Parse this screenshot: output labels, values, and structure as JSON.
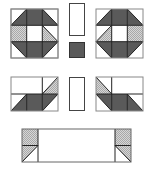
{
  "diagram": {
    "title": "",
    "colors": {
      "dark": "#5a5a5a",
      "check": "#c8c8c8",
      "white": "#ffffff",
      "line": "#2a2a2a",
      "border": "#8a8a8a"
    },
    "pieces": [
      {
        "name": "top-left-block",
        "rows": 3,
        "cols": 3
      },
      {
        "name": "top-center-rectangle"
      },
      {
        "name": "top-center-square"
      },
      {
        "name": "top-right-block",
        "rows": 3,
        "cols": 3
      },
      {
        "name": "middle-left-block",
        "rows": 2,
        "cols": 3
      },
      {
        "name": "middle-center-rectangle"
      },
      {
        "name": "middle-right-block",
        "rows": 2,
        "cols": 3
      },
      {
        "name": "bottom-strip"
      }
    ]
  }
}
